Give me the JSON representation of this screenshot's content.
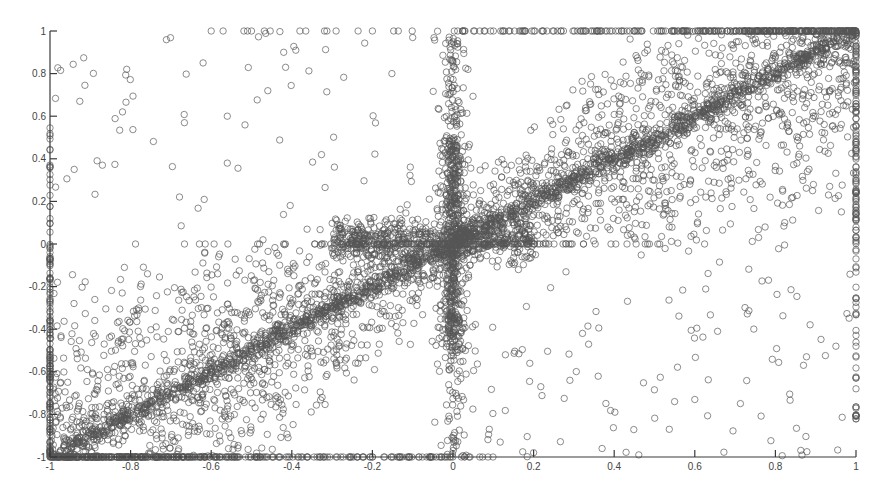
{
  "chart_data": {
    "type": "scatter",
    "title": "",
    "xlabel": "",
    "ylabel": "",
    "xlim": [
      -1,
      1
    ],
    "ylim": [
      -1,
      1
    ],
    "grid": false,
    "legend": null,
    "marker": "open-circle",
    "marker_color": "#555555",
    "x_ticks": [
      -1,
      -0.8,
      -0.6,
      -0.4,
      -0.2,
      0,
      0.2,
      0.4,
      0.6,
      0.8,
      1
    ],
    "x_tick_labels": [
      "-1",
      "-0.8",
      "-0.6",
      "-0.4",
      "-0.2",
      "0",
      "0.2",
      "0.4",
      "0.6",
      "0.8",
      "1"
    ],
    "y_ticks": [
      1,
      0.8,
      0.6,
      0.4,
      0.2,
      0,
      -0.2,
      -0.4,
      -0.6,
      -0.8,
      -1
    ],
    "y_tick_labels": [
      "1",
      "0.8",
      "0.6",
      "0.4",
      "0.2",
      "0",
      "-0.2",
      "-0.4",
      "-0.6",
      "-0.8",
      "-1"
    ],
    "series": [
      {
        "name": "samples",
        "components": [
          {
            "kind": "diagonal",
            "x_range": [
              -1,
              1
            ],
            "slope": 1,
            "intercept": 0,
            "spread": 0.025,
            "count": 1400
          },
          {
            "kind": "quadrant_fill",
            "x_range": [
              0,
              1
            ],
            "y_range": [
              0,
              1
            ],
            "bias": "toward_diagonal",
            "count": 1500
          },
          {
            "kind": "quadrant_fill",
            "x_range": [
              -1,
              0
            ],
            "y_range": [
              -1,
              0
            ],
            "bias": "toward_diagonal",
            "count": 1500
          },
          {
            "kind": "vertical_band",
            "x_center": 0,
            "x_spread": 0.02,
            "y_range": [
              -1,
              1
            ],
            "count": 700
          },
          {
            "kind": "horizontal_band",
            "y_center": 0.02,
            "y_spread": 0.05,
            "x_range": [
              -0.3,
              0.2
            ],
            "count": 600
          },
          {
            "kind": "border",
            "edge": "top",
            "x_range": [
              -0.6,
              1
            ],
            "count": 160
          },
          {
            "kind": "border",
            "edge": "bottom",
            "x_range": [
              -1,
              0.1
            ],
            "count": 200
          },
          {
            "kind": "border",
            "edge": "left",
            "y_range": [
              -1,
              0.55
            ],
            "count": 150
          },
          {
            "kind": "border",
            "edge": "right",
            "y_range": [
              -0.85,
              1
            ],
            "count": 150
          },
          {
            "kind": "sparse",
            "x_range": [
              -1,
              0
            ],
            "y_range": [
              0,
              1
            ],
            "count": 80
          },
          {
            "kind": "sparse",
            "x_range": [
              0,
              1
            ],
            "y_range": [
              -1,
              0
            ],
            "count": 120
          }
        ],
        "sample_points": [
          [
            -0.6,
            1.0
          ],
          [
            -0.38,
            1.0
          ],
          [
            -0.29,
            1.0
          ],
          [
            -0.2,
            1.0
          ],
          [
            -0.62,
            0.85
          ],
          [
            -0.39,
            0.91
          ],
          [
            -0.42,
            0.9
          ],
          [
            -0.56,
            0.6
          ],
          [
            -0.94,
            0.35
          ],
          [
            -0.82,
            0.62
          ],
          [
            -0.87,
            0.37
          ],
          [
            -0.56,
            0.38
          ],
          [
            0.2,
            -0.98
          ],
          [
            0.37,
            -0.96
          ],
          [
            0.55,
            -0.74
          ],
          [
            0.6,
            -0.73
          ],
          [
            1.0,
            -0.82
          ],
          [
            1.0,
            -0.68
          ],
          [
            0.95,
            -0.48
          ],
          [
            0.09,
            -0.87
          ]
        ]
      }
    ]
  },
  "plot_area": {
    "left_px": 50,
    "right_px": 856,
    "top_px": 31,
    "bottom_px": 457
  }
}
